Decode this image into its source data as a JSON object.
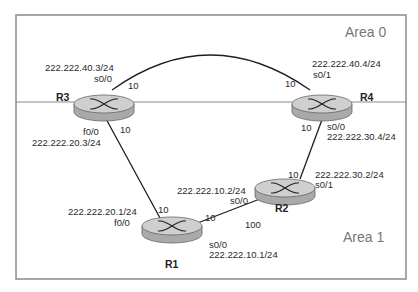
{
  "areas": [
    {
      "id": "area0",
      "label": "Area 0"
    },
    {
      "id": "area1",
      "label": "Area 1"
    }
  ],
  "routers": [
    {
      "id": "R1",
      "label": "R1"
    },
    {
      "id": "R2",
      "label": "R2"
    },
    {
      "id": "R3",
      "label": "R3"
    },
    {
      "id": "R4",
      "label": "R4"
    }
  ],
  "links": [
    {
      "from": "R3",
      "to": "R4",
      "cost_r3": "10",
      "cost_r4": "10",
      "r3_if": "s0/0",
      "r3_ip": "222.222.40.3/24",
      "r4_if": "s0/1",
      "r4_ip": "222.222.40.4/24"
    },
    {
      "from": "R3",
      "to": "R1",
      "cost_r3": "10",
      "cost_r1": "10",
      "r3_if": "f0/0",
      "r3_ip": "222.222.20.3/24",
      "r1_if": "f0/0",
      "r1_ip": "222.222.20.1/24"
    },
    {
      "from": "R4",
      "to": "R2",
      "cost_r4": "10",
      "cost_r2": "10",
      "r4_if": "s0/0",
      "r4_ip": "222.222.30.4/24",
      "r2_if": "s0/1",
      "r2_ip": "222.222.30.2/24"
    },
    {
      "from": "R1",
      "to": "R2",
      "cost_r1": "10",
      "cost_r2": "100",
      "r1_if": "s0/0",
      "r1_ip": "222.222.10.1/24",
      "r2_if": "s0/0",
      "r2_ip": "222.222.10.2/24"
    }
  ],
  "colors": {
    "frame": "#8a8a8a",
    "link": "#1e1e1e",
    "router_top": "#cfcfcf",
    "router_side": "#a9a9a9",
    "area_text": "#777777"
  }
}
